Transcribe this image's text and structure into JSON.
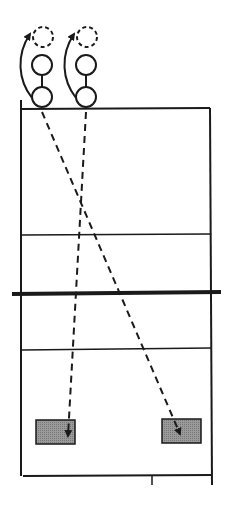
{
  "diagram": {
    "colors": {
      "line": "#1a1a1a",
      "target_fill": "#8a8a8a",
      "background": "#ffffff"
    },
    "court": {
      "left": 21,
      "right": 210,
      "top": 108,
      "bottom": 476
    },
    "lines": {
      "attack_line_top": 235,
      "net": {
        "y": 293,
        "x1": 12,
        "x2": 221
      },
      "attack_line_bottom": 349
    },
    "players": [
      {
        "id": "player-1",
        "bottom_circle": [
          42,
          97
        ],
        "top_circle": [
          42,
          65
        ],
        "ghost_circle": [
          43,
          37
        ]
      },
      {
        "id": "player-2",
        "bottom_circle": [
          86,
          97
        ],
        "top_circle": [
          86,
          65
        ],
        "ghost_circle": [
          87,
          37
        ]
      }
    ],
    "targets": [
      {
        "id": "target-left",
        "x": 36,
        "y": 420,
        "w": 39,
        "h": 24
      },
      {
        "id": "target-right",
        "x": 162,
        "y": 419,
        "w": 39,
        "h": 24
      }
    ],
    "trajectories": [
      {
        "from": [
          42,
          110
        ],
        "to": [
          180,
          436
        ]
      },
      {
        "from": [
          86,
          110
        ],
        "to": [
          68,
          438
        ]
      }
    ]
  }
}
